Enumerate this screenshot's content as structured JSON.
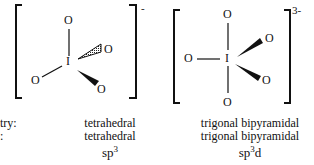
{
  "structures": [
    {
      "id": "IO4-",
      "charge": "-",
      "central_atom": "I",
      "ligands": [
        "O",
        "O",
        "O",
        "O"
      ],
      "geometry_label": "tetrahedral",
      "shape_label": "tetrahedral",
      "hybridization_base": "sp",
      "hybridization_sup": "3",
      "hybridization_suffix": ""
    },
    {
      "id": "IO5 3-",
      "charge": "3-",
      "central_atom": "I",
      "ligands": [
        "O",
        "O",
        "O",
        "O",
        "O"
      ],
      "geometry_label": "trigonal bipyramidal",
      "shape_label": "trigonal bipyramidal",
      "hybridization_base": "sp",
      "hybridization_sup": "3",
      "hybridization_suffix": "d"
    }
  ],
  "row_labels": {
    "geometry": "try:",
    "shape": ":"
  }
}
